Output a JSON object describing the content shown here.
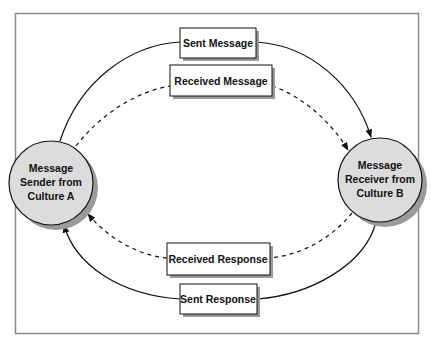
{
  "diagram": {
    "type": "communication-cycle",
    "frame": {
      "x": 15,
      "y": 13,
      "width": 403,
      "height": 320,
      "border_color": "#8a8a8a"
    },
    "colors": {
      "circle_fill": "#dcdcdc",
      "shadow": "#9a9a9a",
      "line": "#111111",
      "box_fill": "#ffffff"
    },
    "nodes": {
      "sender": {
        "lines": [
          "Message",
          "Sender from",
          "Culture A"
        ],
        "cx": 51,
        "cy": 183,
        "r": 42
      },
      "receiver": {
        "lines": [
          "Message",
          "Receiver from",
          "Culture B"
        ],
        "cx": 380,
        "cy": 180,
        "r": 42
      }
    },
    "labels": {
      "sent_message": "Sent Message",
      "received_message": "Received Message",
      "received_response": "Received Response",
      "sent_response": "Sent Response"
    },
    "edges": [
      {
        "from": "sender",
        "to": "receiver",
        "label": "sent_message",
        "style": "solid"
      },
      {
        "from": "sender",
        "to": "receiver",
        "label": "received_message",
        "style": "dashed"
      },
      {
        "from": "receiver",
        "to": "sender",
        "label": "received_response",
        "style": "dashed"
      },
      {
        "from": "receiver",
        "to": "sender",
        "label": "sent_response",
        "style": "solid"
      }
    ]
  }
}
